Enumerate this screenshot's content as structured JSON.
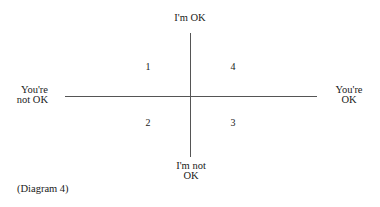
{
  "diagram": {
    "axes": {
      "top": [
        "I'm OK"
      ],
      "bottom": [
        "I'm not",
        "OK"
      ],
      "left": [
        "You're",
        "not OK"
      ],
      "right": [
        "You're",
        "OK"
      ]
    },
    "quadrants": [
      {
        "position": "top-left",
        "label": "1"
      },
      {
        "position": "top-right",
        "label": "4"
      },
      {
        "position": "bottom-left",
        "label": "2"
      },
      {
        "position": "bottom-right",
        "label": "3"
      }
    ],
    "caption": "(Diagram 4)",
    "line_color": "#555555"
  }
}
